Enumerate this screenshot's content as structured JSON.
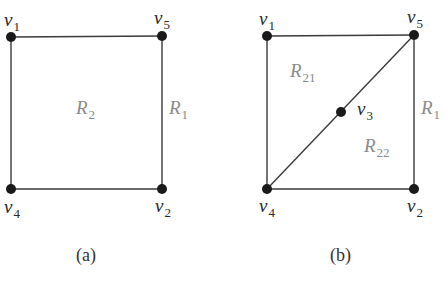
{
  "figures": [
    {
      "id": "a",
      "caption": "(a)",
      "vertices": [
        {
          "name": "v",
          "sub": "1",
          "x": 11,
          "y": 37
        },
        {
          "name": "v",
          "sub": "5",
          "x": 162,
          "y": 36
        },
        {
          "name": "v",
          "sub": "4",
          "x": 11,
          "y": 189
        },
        {
          "name": "v",
          "sub": "2",
          "x": 162,
          "y": 189
        }
      ],
      "edges": [
        [
          "v1",
          "v5"
        ],
        [
          "v1",
          "v4"
        ],
        [
          "v5",
          "v2"
        ],
        [
          "v4",
          "v2"
        ]
      ],
      "regions": [
        {
          "name": "R",
          "sub": "2"
        },
        {
          "name": "R",
          "sub": "1"
        }
      ]
    },
    {
      "id": "b",
      "caption": "(b)",
      "vertices": [
        {
          "name": "v",
          "sub": "1",
          "x": 267,
          "y": 36
        },
        {
          "name": "v",
          "sub": "5",
          "x": 414,
          "y": 35
        },
        {
          "name": "v",
          "sub": "3",
          "x": 341,
          "y": 112
        },
        {
          "name": "v",
          "sub": "4",
          "x": 267,
          "y": 189
        },
        {
          "name": "v",
          "sub": "2",
          "x": 414,
          "y": 189
        }
      ],
      "edges": [
        [
          "v1",
          "v5"
        ],
        [
          "v1",
          "v4"
        ],
        [
          "v5",
          "v2"
        ],
        [
          "v4",
          "v2"
        ],
        [
          "v4",
          "v3"
        ],
        [
          "v3",
          "v5"
        ]
      ],
      "regions": [
        {
          "name": "R",
          "sub": "21"
        },
        {
          "name": "R",
          "sub": "22"
        },
        {
          "name": "R",
          "sub": "1"
        }
      ]
    }
  ]
}
